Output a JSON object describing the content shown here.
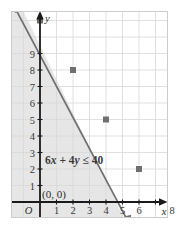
{
  "figure": {
    "kind": "inequality-graph",
    "frame": {
      "x": 11,
      "y": 11,
      "width": 157,
      "height": 207
    },
    "colors": {
      "grid": "#d8d8d8",
      "frame_border": "#cccccc",
      "axis": "#1a1a1a",
      "line": "#6f6f6f",
      "point": "#6f6f6f",
      "shading": "#e6e6e6",
      "text": "#2b2b2b",
      "tick_text": "#3a3a3a",
      "background": "#ffffff"
    }
  },
  "labels": {
    "x_axis_name": "x",
    "y_axis_name": "y",
    "origin": "O",
    "test_point": "(0, 0)",
    "inequality_prefix": "6",
    "inequality_var1": "x",
    "inequality_plus": " + ",
    "inequality_coeff2": "4",
    "inequality_var2": "y",
    "inequality_relation": " ≤ ",
    "inequality_value": "40",
    "inequality_full": "6x + 4y ≤ 40"
  },
  "chart_data": {
    "type": "line",
    "title": "",
    "subtitle": "",
    "xlabel": "x",
    "ylabel": "y",
    "xlim": [
      -1.8,
      9.5
    ],
    "ylim": [
      -1.2,
      11.3
    ],
    "grid": true,
    "legend": "none",
    "x_ticks": [
      {
        "value": 1,
        "label": "1"
      },
      {
        "value": 2,
        "label": "2"
      },
      {
        "value": 3,
        "label": "3"
      },
      {
        "value": 4,
        "label": "4"
      },
      {
        "value": 5,
        "label": "5"
      },
      {
        "value": 6,
        "label": "6"
      },
      {
        "value": 7,
        "label": ""
      },
      {
        "value": 8,
        "label": "8"
      }
    ],
    "y_ticks": [
      {
        "value": 1,
        "label": "1"
      },
      {
        "value": 2,
        "label": "2"
      },
      {
        "value": 3,
        "label": "3"
      },
      {
        "value": 4,
        "label": "4"
      },
      {
        "value": 5,
        "label": "5"
      },
      {
        "value": 6,
        "label": "6"
      },
      {
        "value": 7,
        "label": "7"
      },
      {
        "value": 8,
        "label": "8"
      },
      {
        "value": 9,
        "label": "9"
      },
      {
        "value": 10,
        "label": ""
      }
    ],
    "series": [
      {
        "name": "6x + 4y = 40",
        "type": "line",
        "style": "solid",
        "arrowheads": "both",
        "endpoints": [
          {
            "x": -1.6,
            "y": 12.4
          },
          {
            "x": 7.6,
            "y": -1.4
          }
        ],
        "slope": -1.5,
        "y_intercept": 10,
        "x_intercept": 6.6667,
        "marked_points": [
          {
            "x": 0,
            "y": 10
          },
          {
            "x": 2,
            "y": 7
          },
          {
            "x": 4,
            "y": 4
          },
          {
            "x": 6,
            "y": 1
          }
        ]
      }
    ],
    "shaded_region": {
      "inequality": "6x + 4y ≤ 40",
      "side": "below-left",
      "boundary": "solid",
      "label": "6x + 4y ≤ 40",
      "label_position": {
        "x": 0.3,
        "y": 2.55
      }
    },
    "annotations": [
      {
        "text": "(0, 0)",
        "x": 0.18,
        "y": 0.85,
        "role": "test-point"
      },
      {
        "text": "O",
        "x": -0.62,
        "y": -0.72,
        "role": "origin"
      }
    ]
  }
}
